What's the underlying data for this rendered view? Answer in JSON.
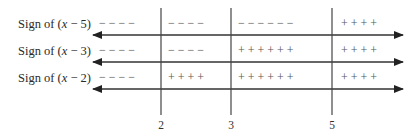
{
  "diagram": {
    "type": "sign-chart",
    "critical_points": [
      {
        "label": "2",
        "x_px": 161
      },
      {
        "label": "3",
        "x_px": 231
      },
      {
        "label": "5",
        "x_px": 332
      }
    ],
    "rows": [
      {
        "label_prefix": "Sign of (",
        "label_var": "x",
        "label_suffix": " − 5)",
        "intervals": [
          "− − − −",
          "− − − −",
          "− − − − − −",
          "+ + + +"
        ]
      },
      {
        "label_prefix": "Sign of (",
        "label_var": "x",
        "label_suffix": " − 3)",
        "intervals": [
          "− − − −",
          "− − − −",
          "+ + + + + +",
          "+ + + +"
        ]
      },
      {
        "label_prefix": "Sign of (",
        "label_var": "x",
        "label_suffix": " − 2)",
        "intervals": [
          "− − − −",
          "+ + + +",
          "+ + + + + +",
          "+ + + +"
        ]
      }
    ],
    "colors": {
      "line": "#333333",
      "text": "#2a2a2a",
      "sign": "#555555"
    }
  }
}
